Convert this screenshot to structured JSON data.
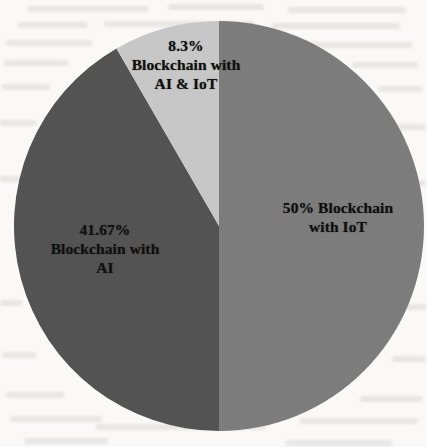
{
  "chart_data": {
    "type": "pie",
    "title": "",
    "subtitle": "",
    "xlabel": "",
    "ylabel": "",
    "legend_position": "none",
    "grid": false,
    "categories": [
      "Blockchain with IoT",
      "Blockchain with AI",
      "Blockchain with AI & IoT"
    ],
    "values": [
      50,
      41.67,
      8.3
    ],
    "value_labels": [
      "50%",
      "41.67%",
      "8.3%"
    ],
    "colors": [
      "#7d7d7d",
      "#545454",
      "#c8c8c8"
    ],
    "slices": [
      {
        "name": "Blockchain with IoT",
        "value": 50,
        "value_label": "50%",
        "color": "#7d7d7d",
        "start_angle": 0,
        "end_angle": 180,
        "label_lines": [
          "50% Blockchain",
          "with IoT"
        ]
      },
      {
        "name": "Blockchain with AI",
        "value": 41.67,
        "value_label": "41.67%",
        "color": "#545454",
        "start_angle": 180,
        "end_angle": 330,
        "label_lines": [
          "41.67%",
          "Blockchain with",
          "AI"
        ]
      },
      {
        "name": "Blockchain with AI & IoT",
        "value": 8.3,
        "value_label": "8.3%",
        "color": "#c8c8c8",
        "start_angle": 330,
        "end_angle": 360,
        "label_lines": [
          "8.3%",
          "Blockchain with",
          "AI & IoT"
        ]
      }
    ]
  },
  "labels": {
    "ai_iot": {
      "line1": "8.3%",
      "line2": "Blockchain with",
      "line3": "AI & IoT"
    },
    "ai": {
      "line1": "41.67%",
      "line2": "Blockchain with",
      "line3": "AI"
    },
    "iot": {
      "line1": "50% Blockchain",
      "line2": "with IoT"
    }
  },
  "geometry": {
    "center_x": 219,
    "center_y": 226,
    "radius": 205
  },
  "style": {
    "background": "#fbfaf8",
    "text_color": "#111010",
    "slice_iot": "#7d7d7d",
    "slice_ai": "#545454",
    "slice_ai_iot": "#c8c8c8"
  }
}
